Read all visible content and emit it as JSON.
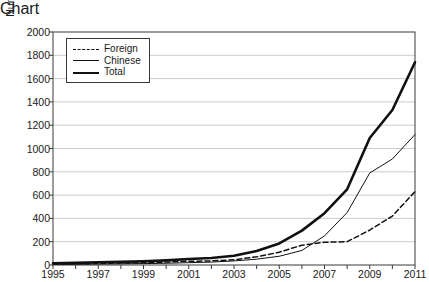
{
  "chart_data": {
    "type": "line",
    "title": "",
    "xlabel": "",
    "ylabel": "Number of invention patents granted in China",
    "xlim": [
      1995,
      2011
    ],
    "ylim": [
      0,
      2000
    ],
    "grid": true,
    "legend_position": "top-left",
    "x": [
      1995,
      1996,
      1997,
      1998,
      1999,
      2000,
      2001,
      2002,
      2003,
      2004,
      2005,
      2006,
      2007,
      2008,
      2009,
      2010,
      2011
    ],
    "xticks": [
      1995,
      1997,
      1999,
      2001,
      2003,
      2005,
      2007,
      2009,
      2011
    ],
    "xtick_labels": [
      "1995",
      "1997",
      "1999",
      "2001",
      "2003",
      "2005",
      "2007",
      "2009",
      "2011"
    ],
    "yticks": [
      0,
      200,
      400,
      600,
      800,
      1000,
      1200,
      1400,
      1600,
      1800,
      2000
    ],
    "ytick_labels": [
      "0",
      "200",
      "400",
      "600",
      "800",
      "1000",
      "1200",
      "1400",
      "1600",
      "1800",
      "2000"
    ],
    "series": [
      {
        "name": "Foreign",
        "style": "dashed",
        "values": [
          10,
          12,
          15,
          17,
          20,
          25,
          32,
          35,
          45,
          70,
          110,
          170,
          195,
          200,
          300,
          420,
          630
        ]
      },
      {
        "name": "Chinese",
        "style": "thin-solid",
        "values": [
          5,
          6,
          8,
          10,
          12,
          15,
          20,
          25,
          35,
          50,
          75,
          125,
          250,
          450,
          790,
          910,
          1120
        ]
      },
      {
        "name": "Total",
        "style": "thick-solid",
        "values": [
          15,
          18,
          23,
          27,
          32,
          40,
          52,
          60,
          80,
          120,
          185,
          295,
          445,
          650,
          1090,
          1330,
          1740
        ]
      }
    ]
  },
  "legend": {
    "items": [
      {
        "label": "Foreign"
      },
      {
        "label": "Chinese"
      },
      {
        "label": "Total"
      }
    ]
  },
  "colors": {
    "line": "#111111",
    "grid": "#cccccc",
    "frame": "#3a3a3a",
    "background": "#ffffff"
  }
}
